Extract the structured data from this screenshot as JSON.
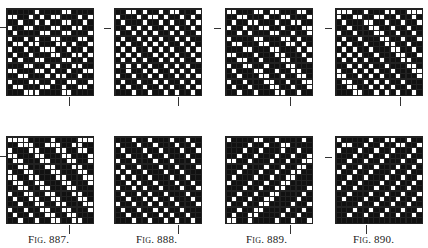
{
  "figures": [
    {
      "caption": "Fig. 887.",
      "grid": {
        "left": 6,
        "top": 8
      },
      "marks": {
        "h": {
          "left": -1,
          "top": 27
        },
        "v": {
          "left": 69,
          "top": 97
        }
      },
      "caption_pos": {
        "left": 28,
        "top": 233
      },
      "rows": [
        "1111101111001111",
        "0011010100111010",
        "1101101011001101",
        "0110011100110011",
        "1011110011001110",
        "0110101100111001",
        "1001001110010110",
        "0110110001101101",
        "1011011100110010",
        "0101100111001101",
        "1110011010110011",
        "0011100101101100",
        "1100111010011011",
        "0111001101100110",
        "1001110011011001",
        "1110001111001111"
      ]
    },
    {
      "caption": "Fig. 888.",
      "grid": {
        "left": 114,
        "top": 8
      },
      "marks": {
        "h": {
          "left": 104,
          "top": 28
        },
        "v": {
          "left": 178,
          "top": 97
        }
      },
      "caption_pos": {
        "left": 136,
        "top": 233
      },
      "rows": [
        "1100101101001110",
        "0111010010110101",
        "1011101101011010",
        "1101010110101101",
        "0110101011010110",
        "1011010101101011",
        "0101101010110101",
        "1010110101011010",
        "0101011010101101",
        "1010101101010110",
        "0101010110101011",
        "1101101011010101",
        "0110110101101010",
        "1011011010110101",
        "0101101101011010",
        "1110110110101101"
      ]
    },
    {
      "caption": "Fig. 889.",
      "grid": {
        "left": 225,
        "top": 8
      },
      "marks": {
        "h": {
          "left": 214,
          "top": 28
        },
        "v": {
          "left": 290,
          "top": 97
        }
      },
      "caption_pos": {
        "left": 246,
        "top": 233
      },
      "rows": [
        "0011100100111001",
        "1100111011001110",
        "1011001110110011",
        "0110110011011100",
        "1101011100110110",
        "0111100111001011",
        "1001110011100101",
        "1110011100111010",
        "0011101110011101",
        "1100110111001110",
        "0110011011100111",
        "1011100110110011",
        "1101110011011001",
        "0110111001101100",
        "1011011100110110",
        "1101101110011011"
      ]
    },
    {
      "caption": "Fig. 890.",
      "grid": {
        "left": 335,
        "top": 8
      },
      "marks": {
        "h": {
          "left": 325,
          "top": 28
        },
        "v": {
          "left": 400,
          "top": 97
        }
      },
      "caption_pos": {
        "left": 353,
        "top": 233
      },
      "rows": [
        "0001101110011000",
        "0110011001101101",
        "1011100110110110",
        "1101110011011011",
        "0110111001101101",
        "1011011100110110",
        "0101101110011011",
        "1010110111001101",
        "0101011011100110",
        "1010101101110011",
        "1101010110111001",
        "0110101011011100",
        "0011010101101110",
        "1001101010110111",
        "1100110101011011",
        "1110011010101101"
      ]
    },
    {
      "caption": "",
      "grid": {
        "left": 6,
        "top": 136
      },
      "marks": {
        "h": {
          "left": -1,
          "top": 156
        },
        "v": {
          "left": 69,
          "top": 225
        }
      },
      "rows": [
        "0000111101111000",
        "1100011000110011",
        "0111001110011001",
        "0011100111001110",
        "1001110011100110",
        "1100111001110011",
        "0110011100111001",
        "0011001110011100",
        "1001100111001110",
        "1100110011100111",
        "0110011001110011",
        "1011001100111001",
        "1101100110011100",
        "0110110011001110",
        "1011011001100111",
        "1101101100110011"
      ]
    },
    {
      "caption": "",
      "grid": {
        "left": 114,
        "top": 136
      },
      "marks": {
        "v": {
          "left": 178,
          "top": 225
        }
      },
      "rows": [
        "1110110111011011",
        "0111011011101101",
        "1011101101110110",
        "1101110110111011",
        "0110111011011101",
        "1011011101101110",
        "0101101110110111",
        "1010110111011011",
        "1101011011101101",
        "0110101101110110",
        "1011010110111011",
        "1101101011011101",
        "0110110101101110",
        "1011011010110111",
        "1101101101011011",
        "1110110110101101"
      ]
    },
    {
      "caption": "",
      "grid": {
        "left": 225,
        "top": 136
      },
      "marks": {
        "v": {
          "left": 290,
          "top": 225
        }
      },
      "rows": [
        "0111100110111101",
        "1111011011001111",
        "1110110111011011",
        "1101101110110110",
        "0011011101101100",
        "1110111011011001",
        "1101110110110011",
        "1011101101100111",
        "0111011011001111",
        "1110110110011110",
        "1101101100111101",
        "1011011001111011",
        "0110110011110110",
        "1101100111101101",
        "1011001111011011",
        "0011011110110110"
      ]
    },
    {
      "caption": "",
      "grid": {
        "left": 335,
        "top": 136
      },
      "marks": {
        "h": {
          "left": 325,
          "top": 157
        },
        "v": {
          "left": 366,
          "top": 225
        }
      },
      "rows": [
        "0111110110011011",
        "1001101101100110",
        "0111011011011101",
        "1110110110111011",
        "1101101101110110",
        "1011011011101101",
        "0110110111011011",
        "1101101110110110",
        "1011011101101101",
        "0110111011011011",
        "1101110110110110",
        "1011101101101101",
        "1111011011011011",
        "1110110110110110",
        "1101101101101101",
        "1111111111111111"
      ]
    }
  ]
}
